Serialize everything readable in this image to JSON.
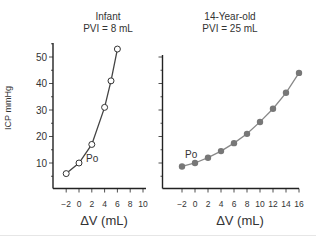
{
  "chart_data": [
    {
      "type": "line",
      "title": "Infant",
      "subtitle": "PVI = 8 mL",
      "xlabel": "ΔV (mL)",
      "ylabel": "ICP mmHg",
      "x_ticks": [
        -2,
        0,
        2,
        4,
        6,
        8,
        10
      ],
      "y_ticks": [
        10,
        20,
        30,
        40,
        50
      ],
      "xlim": [
        -3,
        10.5
      ],
      "ylim": [
        0,
        55
      ],
      "grid": false,
      "marker": "open-circle",
      "series": [
        {
          "name": "Infant",
          "x": [
            -2,
            0,
            2,
            4,
            5,
            6
          ],
          "values": [
            6,
            10,
            17,
            31,
            41,
            53
          ]
        }
      ],
      "annotations": [
        {
          "text": "Po",
          "x": 0,
          "y": 10
        }
      ]
    },
    {
      "type": "line",
      "title": "14-Year-old",
      "subtitle": "PVI = 25 mL",
      "xlabel": "ΔV (mL)",
      "ylabel": "",
      "x_ticks": [
        -2,
        0,
        2,
        4,
        6,
        8,
        10,
        12,
        14,
        16
      ],
      "y_ticks": [
        10,
        20,
        30,
        40,
        50
      ],
      "xlim": [
        -5,
        16
      ],
      "ylim": [
        0,
        55
      ],
      "grid": false,
      "marker": "filled-circle",
      "series": [
        {
          "name": "14-Year-old",
          "x": [
            -2,
            0,
            2,
            4,
            6,
            8,
            10,
            12,
            14,
            16
          ],
          "values": [
            8.7,
            10,
            12,
            14.5,
            17.5,
            21,
            25.5,
            30.5,
            36.5,
            44
          ]
        }
      ],
      "annotations": [
        {
          "text": "Po",
          "x": 0,
          "y": 10
        }
      ]
    }
  ],
  "colors": {
    "axis": "#222222",
    "infant_line": "#444444",
    "teen_line": "#888888",
    "teen_marker": "#777777"
  }
}
